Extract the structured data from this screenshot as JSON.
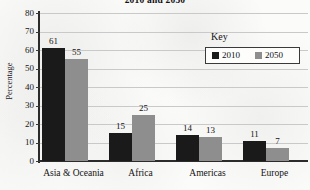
{
  "chart_data": {
    "type": "bar",
    "title": "2010 and 2050",
    "xlabel": "",
    "ylabel": "Percentage",
    "ylim": [
      0,
      80
    ],
    "ytick_step": 10,
    "yticks": [
      80,
      70,
      60,
      50,
      40,
      30,
      20,
      10,
      0
    ],
    "grid": true,
    "legend_position": "top-right",
    "legend_title": "Key",
    "categories": [
      "Asia & Oceania",
      "Africa",
      "Americas",
      "Europe"
    ],
    "series": [
      {
        "name": "2010",
        "color": "#1a1a1a",
        "values": [
          61,
          15,
          14,
          11
        ]
      },
      {
        "name": "2050",
        "color": "#8e8e8e",
        "values": [
          55,
          25,
          13,
          7
        ]
      }
    ]
  },
  "colors": {
    "series_2010": "#1a1a1a",
    "series_2050": "#8e8e8e",
    "axis": "#2b2b2b",
    "gridline": "#c9c9c9",
    "background": "#fbfbfa"
  }
}
